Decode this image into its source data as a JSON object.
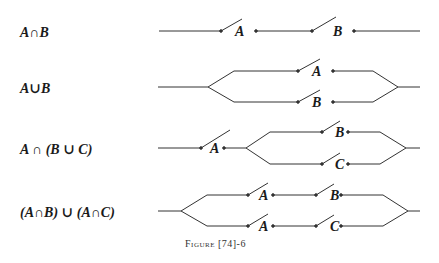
{
  "diagram": {
    "rows": [
      {
        "expression": "A∩B",
        "switches": [
          "A",
          "B"
        ],
        "topology": "series"
      },
      {
        "expression": "A∪B",
        "switches": [
          "A",
          "B"
        ],
        "topology": "parallel"
      },
      {
        "expression": "A ∩ (B ∪ C)",
        "switches": [
          "A",
          "B",
          "C"
        ],
        "topology": "series-then-parallel"
      },
      {
        "expression": "(A∩B) ∪ (A∩C)",
        "switches": [
          "A",
          "B",
          "A",
          "C"
        ],
        "topology": "parallel-of-series"
      }
    ],
    "caption": "Figure [74]-6",
    "line_color": "#333333"
  }
}
